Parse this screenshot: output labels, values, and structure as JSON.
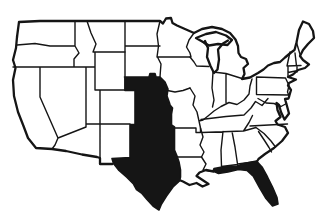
{
  "map": {
    "title": "Outline map of the contiguous United States",
    "country": "United States (lower 48 states)",
    "highlighted_states": [
      "Nebraska",
      "Kansas",
      "Oklahoma",
      "Texas",
      "Florida"
    ],
    "highlight_regions": [
      {
        "id": "central-block",
        "states": [
          "Nebraska",
          "Kansas",
          "Oklahoma",
          "Texas"
        ]
      },
      {
        "id": "florida",
        "states": [
          "Florida"
        ]
      }
    ],
    "colors": {
      "background": "#ffffff",
      "line": "#151515",
      "highlight_fill": "#151515",
      "state_fill": "#ffffff"
    }
  }
}
